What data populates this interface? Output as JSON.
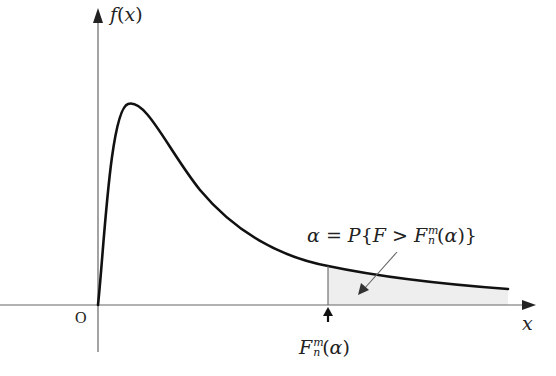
{
  "diagram": {
    "axes": {
      "y_label": {
        "func": "f",
        "arg": "x"
      },
      "x_label": "x",
      "origin_label": "O"
    },
    "annotation": {
      "alpha": "α",
      "equals": " = ",
      "prob": "P",
      "lbrace": "{",
      "var": "F",
      "gt": " > ",
      "crit_base": "F",
      "crit_sup": "m",
      "crit_sub": "n",
      "crit_arg_open": "(",
      "crit_arg": "α",
      "crit_arg_close": ")",
      "rbrace": "}"
    },
    "critical_value_label": {
      "base": "F",
      "sup": "m",
      "sub": "n",
      "open": "(",
      "arg": "α",
      "close": ")"
    },
    "colors": {
      "curve": "#111111",
      "axes": "#555555",
      "shade": "#eeeeee",
      "text": "#222222"
    },
    "geometry": {
      "origin_px": [
        98,
        305
      ],
      "peak_px": [
        130,
        104
      ],
      "critical_x_px": 328,
      "tail_end_px": [
        508,
        289
      ]
    }
  }
}
